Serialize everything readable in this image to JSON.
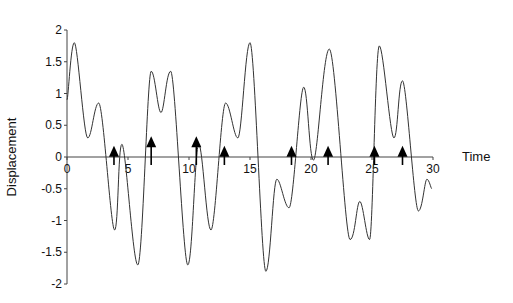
{
  "chart_data": {
    "type": "line",
    "title": "",
    "xlabel": "Time",
    "ylabel": "Displacement",
    "xlim": [
      0,
      30
    ],
    "ylim": [
      -2,
      2
    ],
    "grid": false,
    "legend": null,
    "x_ticks": [
      "0",
      "5",
      "10",
      "15",
      "20",
      "25",
      "30"
    ],
    "y_ticks": [
      "-2",
      "-1.5",
      "-1",
      "-0.5",
      "0",
      "0.5",
      "1",
      "1.5",
      "2"
    ],
    "series": [
      {
        "name": "displacement",
        "x": [
          0,
          0.6,
          1.7,
          2.6,
          3.9,
          4.5,
          5.8,
          6.9,
          7.7,
          8.5,
          9.9,
          10.8,
          11.8,
          13.0,
          14.0,
          15.0,
          16.3,
          17.2,
          18.2,
          19.4,
          20.2,
          21.5,
          23.2,
          24.0,
          24.8,
          25.6,
          26.8,
          27.5,
          28.8,
          29.5,
          29.9
        ],
        "y": [
          0.9,
          1.8,
          0.3,
          0.85,
          -1.15,
          0.2,
          -1.7,
          1.35,
          0.7,
          1.35,
          -1.7,
          0.2,
          -1.15,
          0.85,
          0.3,
          1.8,
          -1.8,
          -0.35,
          -0.8,
          1.1,
          -0.05,
          1.7,
          -1.3,
          -0.7,
          -1.3,
          1.75,
          0.3,
          1.2,
          -0.85,
          -0.35,
          -0.5
        ]
      }
    ],
    "annotations": {
      "type": "upward-arrows",
      "x": [
        3.85,
        6.9,
        10.6,
        12.9,
        18.4,
        21.4,
        25.2,
        27.5
      ],
      "tip_y": [
        0.05,
        0.2,
        0.2,
        0.05,
        0.05,
        0.05,
        0.05,
        0.05
      ]
    }
  }
}
